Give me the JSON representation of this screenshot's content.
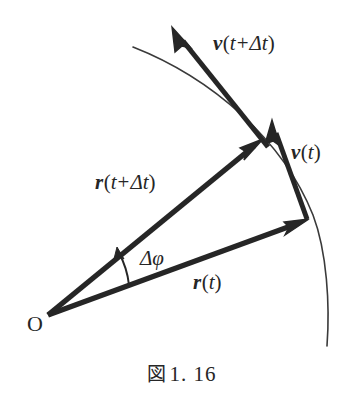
{
  "figure": {
    "caption_label": "図",
    "caption_number": "1. 16",
    "caption_full": "図 1. 16",
    "background_color": "#ffffff",
    "ink_color": "#262626",
    "width": 363,
    "height": 408
  },
  "labels": {
    "origin": "O",
    "position_now": {
      "vector": "r",
      "arg_open": "(",
      "arg": "t",
      "arg_close": ")",
      "full": "r(t)"
    },
    "position_later": {
      "vector": "r",
      "arg_open": "(",
      "arg": "t",
      "plus": "+",
      "delta": "Δ",
      "arg2": "t",
      "arg_close": ")",
      "full": "r(t+Δt)"
    },
    "velocity_now": {
      "vector": "v",
      "arg_open": "(",
      "arg": "t",
      "arg_close": ")",
      "full": "v(t)"
    },
    "velocity_later": {
      "vector": "v",
      "arg_open": "(",
      "arg": "t",
      "plus": "+",
      "delta": "Δ",
      "arg2": "t",
      "arg_close": ")",
      "full": "v(t+Δt)"
    },
    "angle": {
      "delta": "Δ",
      "symbol": "φ",
      "full": "Δφ"
    }
  },
  "geometry": {
    "origin_point": [
      48,
      315
    ],
    "position_now_tip": [
      308,
      220
    ],
    "position_later_tip": [
      262,
      140
    ],
    "velocity_now_tail": [
      306,
      218
    ],
    "velocity_now_tip": [
      272,
      121
    ],
    "velocity_later_tail": [
      265,
      144
    ],
    "velocity_later_tip": [
      173,
      28
    ],
    "trajectory_start": [
      133,
      47
    ],
    "trajectory_end": [
      327,
      346
    ],
    "angle_arc_radius": 86
  }
}
